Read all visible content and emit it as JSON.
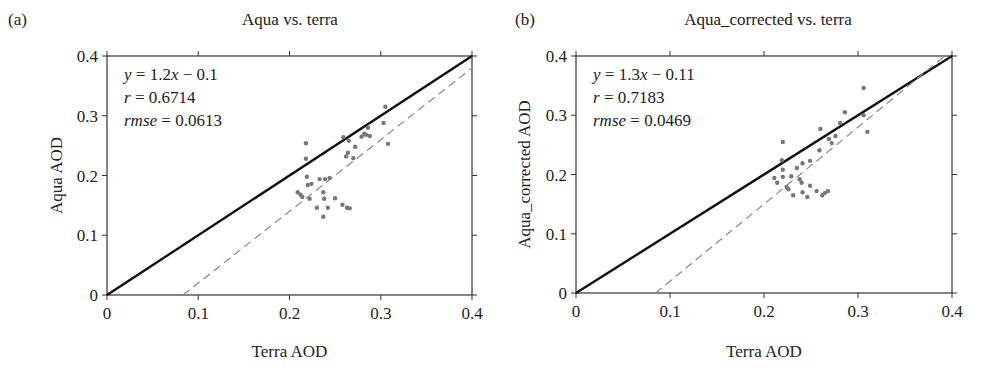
{
  "chart_data": [
    {
      "type": "scatter",
      "panel_label": "(a)",
      "title": "Aqua vs. terra",
      "xlabel": "Terra AOD",
      "ylabel": "Aqua AOD",
      "xlim": [
        0,
        0.4
      ],
      "ylim": [
        0,
        0.4
      ],
      "xticks": [
        "0",
        "0.1",
        "0.2",
        "0.3",
        "0.4"
      ],
      "yticks": [
        "0",
        "0.1",
        "0.2",
        "0.3",
        "0.4"
      ],
      "grid": false,
      "annotations": {
        "equation": "y = 1.2x − 0.1",
        "r": "r = 0.6714",
        "rmse": "rmse = 0.0613"
      },
      "lines": [
        {
          "name": "1:1 line",
          "style": "solid",
          "color": "#111111",
          "x": [
            0,
            0.4
          ],
          "y": [
            0,
            0.4
          ]
        },
        {
          "name": "regression fit",
          "style": "dashed",
          "color": "#888888",
          "slope": 1.2,
          "intercept": -0.1,
          "x": [
            0.0833,
            0.4
          ],
          "y": [
            0,
            0.38
          ]
        }
      ],
      "points": [
        [
          0.305,
          0.315
        ],
        [
          0.303,
          0.288
        ],
        [
          0.308,
          0.253
        ],
        [
          0.218,
          0.254
        ],
        [
          0.218,
          0.228
        ],
        [
          0.259,
          0.264
        ],
        [
          0.265,
          0.258
        ],
        [
          0.272,
          0.248
        ],
        [
          0.279,
          0.265
        ],
        [
          0.284,
          0.268
        ],
        [
          0.286,
          0.28
        ],
        [
          0.288,
          0.266
        ],
        [
          0.264,
          0.238
        ],
        [
          0.27,
          0.229
        ],
        [
          0.219,
          0.198
        ],
        [
          0.22,
          0.184
        ],
        [
          0.233,
          0.194
        ],
        [
          0.239,
          0.194
        ],
        [
          0.209,
          0.172
        ],
        [
          0.214,
          0.164
        ],
        [
          0.222,
          0.161
        ],
        [
          0.237,
          0.172
        ],
        [
          0.238,
          0.161
        ],
        [
          0.25,
          0.162
        ],
        [
          0.23,
          0.146
        ],
        [
          0.242,
          0.146
        ],
        [
          0.258,
          0.151
        ],
        [
          0.263,
          0.146
        ],
        [
          0.237,
          0.131
        ],
        [
          0.224,
          0.186
        ],
        [
          0.244,
          0.196
        ],
        [
          0.212,
          0.168
        ],
        [
          0.266,
          0.145
        ],
        [
          0.282,
          0.27
        ],
        [
          0.262,
          0.232
        ]
      ],
      "point_color": "#777777"
    },
    {
      "type": "scatter",
      "panel_label": "(b)",
      "title": "Aqua_corrected vs. terra",
      "xlabel": "Terra AOD",
      "ylabel": "Aqua_corrected AOD",
      "xlim": [
        0,
        0.4
      ],
      "ylim": [
        0,
        0.4
      ],
      "xticks": [
        "0",
        "0.1",
        "0.2",
        "0.3",
        "0.4"
      ],
      "yticks": [
        "0",
        "0.1",
        "0.2",
        "0.3",
        "0.4"
      ],
      "grid": false,
      "annotations": {
        "equation": "y = 1.3x − 0.11",
        "r": "r = 0.7183",
        "rmse": "rmse = 0.0469"
      },
      "lines": [
        {
          "name": "1:1 line",
          "style": "solid",
          "color": "#111111",
          "x": [
            0,
            0.4
          ],
          "y": [
            0,
            0.4
          ]
        },
        {
          "name": "regression fit",
          "style": "dashed",
          "color": "#888888",
          "slope": 1.3,
          "intercept": -0.11,
          "x": [
            0.0846,
            0.3923
          ],
          "y": [
            0,
            0.4
          ]
        }
      ],
      "points": [
        [
          0.306,
          0.346
        ],
        [
          0.286,
          0.305
        ],
        [
          0.281,
          0.287
        ],
        [
          0.31,
          0.272
        ],
        [
          0.26,
          0.277
        ],
        [
          0.22,
          0.255
        ],
        [
          0.269,
          0.26
        ],
        [
          0.272,
          0.253
        ],
        [
          0.259,
          0.241
        ],
        [
          0.219,
          0.224
        ],
        [
          0.241,
          0.219
        ],
        [
          0.249,
          0.223
        ],
        [
          0.235,
          0.211
        ],
        [
          0.22,
          0.208
        ],
        [
          0.211,
          0.194
        ],
        [
          0.22,
          0.196
        ],
        [
          0.229,
          0.197
        ],
        [
          0.238,
          0.192
        ],
        [
          0.214,
          0.186
        ],
        [
          0.24,
          0.186
        ],
        [
          0.224,
          0.179
        ],
        [
          0.249,
          0.181
        ],
        [
          0.256,
          0.172
        ],
        [
          0.241,
          0.17
        ],
        [
          0.231,
          0.165
        ],
        [
          0.262,
          0.165
        ],
        [
          0.265,
          0.169
        ],
        [
          0.246,
          0.162
        ],
        [
          0.226,
          0.175
        ],
        [
          0.268,
          0.172
        ],
        [
          0.306,
          0.3
        ],
        [
          0.276,
          0.265
        ]
      ],
      "point_color": "#777777"
    }
  ]
}
